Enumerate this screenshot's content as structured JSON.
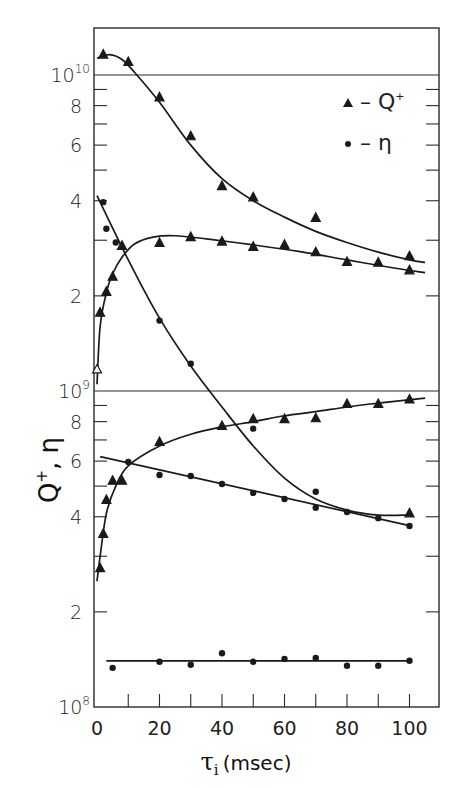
{
  "chart_data": {
    "type": "scatter",
    "title": "",
    "xlabel": "τi (msec)",
    "ylabel": "Q+, η",
    "yscale": "log",
    "xlim": [
      0,
      110
    ],
    "ylim": [
      100000000.0,
      12500000000.0
    ],
    "x_ticks": [
      0,
      20,
      40,
      60,
      80,
      100
    ],
    "x_minor_ticks": [
      10,
      30,
      50,
      70,
      90
    ],
    "y_tick_labels": [
      {
        "value": 100000000.0,
        "label": "10",
        "sup": "8"
      },
      {
        "value": 200000000.0,
        "label": "2"
      },
      {
        "value": 400000000.0,
        "label": "4"
      },
      {
        "value": 600000000.0,
        "label": "6"
      },
      {
        "value": 800000000.0,
        "label": "8"
      },
      {
        "value": 1000000000.0,
        "label": "10",
        "sup": "9"
      },
      {
        "value": 2000000000.0,
        "label": "2"
      },
      {
        "value": 4000000000.0,
        "label": "4"
      },
      {
        "value": 6000000000.0,
        "label": "6"
      },
      {
        "value": 8000000000.0,
        "label": "8"
      },
      {
        "value": 10000000000.0,
        "label": "10",
        "sup": "10"
      }
    ],
    "grid": false,
    "decade_lines": [
      1000000000.0,
      10000000000.0
    ],
    "legend": {
      "position": "upper right",
      "entries": [
        {
          "marker": "triangle",
          "label": "– Q+"
        },
        {
          "marker": "circle",
          "label": "– η"
        }
      ]
    },
    "series": [
      {
        "name": "Q+ (upper)",
        "marker": "triangle",
        "points": [
          [
            2,
            11600000000.0
          ],
          [
            10,
            11000000000.0
          ],
          [
            20,
            8500000000.0
          ],
          [
            30,
            6400000000.0
          ],
          [
            40,
            4450000000.0
          ],
          [
            50,
            4100000000.0
          ],
          [
            70,
            3530000000.0
          ],
          [
            100,
            2670000000.0
          ]
        ],
        "curve": [
          [
            0,
            11300000000.0
          ],
          [
            4,
            11600000000.0
          ],
          [
            8,
            11200000000.0
          ],
          [
            12,
            10200000000.0
          ],
          [
            20,
            8200000000.0
          ],
          [
            30,
            6000000000.0
          ],
          [
            40,
            4700000000.0
          ],
          [
            50,
            4000000000.0
          ],
          [
            60,
            3550000000.0
          ],
          [
            70,
            3200000000.0
          ],
          [
            80,
            2950000000.0
          ],
          [
            90,
            2750000000.0
          ],
          [
            100,
            2600000000.0
          ],
          [
            105,
            2550000000.0
          ]
        ]
      },
      {
        "name": "Q+ (middle)",
        "marker": "triangle",
        "points": [
          [
            1,
            1770000000.0
          ],
          [
            3,
            2060000000.0
          ],
          [
            5,
            2300000000.0
          ],
          [
            8,
            2880000000.0
          ],
          [
            20,
            2940000000.0
          ],
          [
            30,
            3070000000.0
          ],
          [
            40,
            2970000000.0
          ],
          [
            50,
            2860000000.0
          ],
          [
            60,
            2900000000.0
          ],
          [
            70,
            2750000000.0
          ],
          [
            80,
            2560000000.0
          ],
          [
            90,
            2550000000.0
          ],
          [
            100,
            2410000000.0
          ]
        ],
        "open_points": [
          [
            0,
            1170000000.0
          ]
        ],
        "curve": [
          [
            0,
            1050000000.0
          ],
          [
            1,
            1600000000.0
          ],
          [
            3,
            2050000000.0
          ],
          [
            5,
            2350000000.0
          ],
          [
            8,
            2650000000.0
          ],
          [
            12,
            2920000000.0
          ],
          [
            18,
            3070000000.0
          ],
          [
            25,
            3100000000.0
          ],
          [
            35,
            3030000000.0
          ],
          [
            50,
            2900000000.0
          ],
          [
            65,
            2760000000.0
          ],
          [
            80,
            2600000000.0
          ],
          [
            95,
            2450000000.0
          ],
          [
            105,
            2370000000.0
          ]
        ]
      },
      {
        "name": "η (steep)",
        "marker": "circle",
        "points": [
          [
            2,
            3960000000.0
          ],
          [
            3,
            3260000000.0
          ],
          [
            6,
            2950000000.0
          ],
          [
            20,
            1670000000.0
          ],
          [
            30,
            1220000000.0
          ],
          [
            50,
            760000000.0
          ],
          [
            70,
            480000000.0
          ]
        ],
        "curve": [
          [
            0,
            4150000000.0
          ],
          [
            10,
            2600000000.0
          ],
          [
            20,
            1700000000.0
          ],
          [
            30,
            1200000000.0
          ],
          [
            40,
            890000000.0
          ],
          [
            50,
            670000000.0
          ],
          [
            60,
            530000000.0
          ],
          [
            70,
            455000000.0
          ],
          [
            80,
            420000000.0
          ],
          [
            90,
            405000000.0
          ],
          [
            100,
            405000000.0
          ]
        ]
      },
      {
        "name": "Q+ (steep tail end)",
        "marker": "triangle",
        "points": [
          [
            100,
            410000000.0
          ]
        ]
      },
      {
        "name": "Q+ (lower)",
        "marker": "triangle",
        "points": [
          [
            1,
            275000000.0
          ],
          [
            2,
            353000000.0
          ],
          [
            3,
            452000000.0
          ],
          [
            5,
            520000000.0
          ],
          [
            8,
            520000000.0
          ],
          [
            20,
            690000000.0
          ],
          [
            40,
            775000000.0
          ],
          [
            50,
            815000000.0
          ],
          [
            60,
            815000000.0
          ],
          [
            70,
            820000000.0
          ],
          [
            80,
            910000000.0
          ],
          [
            90,
            910000000.0
          ],
          [
            100,
            940000000.0
          ]
        ],
        "curve": [
          [
            0,
            250000000.0
          ],
          [
            1,
            300000000.0
          ],
          [
            3,
            410000000.0
          ],
          [
            6,
            500000000.0
          ],
          [
            10,
            580000000.0
          ],
          [
            20,
            670000000.0
          ],
          [
            30,
            730000000.0
          ],
          [
            40,
            770000000.0
          ],
          [
            50,
            800000000.0
          ],
          [
            60,
            835000000.0
          ],
          [
            70,
            860000000.0
          ],
          [
            80,
            890000000.0
          ],
          [
            90,
            915000000.0
          ],
          [
            105,
            950000000.0
          ]
        ]
      },
      {
        "name": "η (lower)",
        "marker": "circle",
        "points": [
          [
            10,
            596000000.0
          ],
          [
            20,
            542000000.0
          ],
          [
            30,
            538000000.0
          ],
          [
            40,
            508000000.0
          ],
          [
            50,
            476000000.0
          ],
          [
            60,
            455000000.0
          ],
          [
            70,
            427000000.0
          ],
          [
            80,
            414000000.0
          ],
          [
            90,
            396000000.0
          ],
          [
            100,
            374000000.0
          ]
        ],
        "curve": [
          [
            1,
            620000000.0
          ],
          [
            100,
            375000000.0
          ]
        ]
      },
      {
        "name": "η (bottom)",
        "marker": "circle",
        "points": [
          [
            5,
            133000000.0
          ],
          [
            20,
            139000000.0
          ],
          [
            30,
            136000000.0
          ],
          [
            40,
            148000000.0
          ],
          [
            50,
            139000000.0
          ],
          [
            60,
            142000000.0
          ],
          [
            70,
            143000000.0
          ],
          [
            80,
            135000000.0
          ],
          [
            90,
            135000000.0
          ],
          [
            100,
            140000000.0
          ]
        ],
        "curve": [
          [
            3,
            140000000.0
          ],
          [
            100,
            140000000.0
          ]
        ]
      }
    ],
    "colors": {
      "ink": "#1a1a1a",
      "background": "#ffffff"
    }
  },
  "axes": {
    "x_title": "τ",
    "x_title_sub": "i",
    "x_title_unit": "(msec)",
    "y_title": "Q",
    "y_title_sup": "+",
    "y_title_rest": ", η"
  },
  "legend": {
    "q_label": "– Q",
    "q_sup": "+",
    "eta_label": "– η"
  }
}
